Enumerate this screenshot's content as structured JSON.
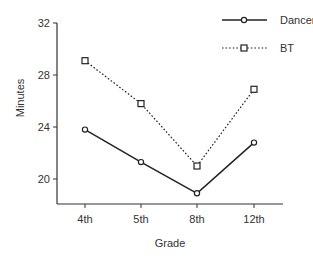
{
  "chart_data": {
    "type": "line",
    "title": "",
    "xlabel": "Grade",
    "ylabel": "Minutes",
    "categories": [
      "4th",
      "5th",
      "8th",
      "12th"
    ],
    "series": [
      {
        "name": "Dancer",
        "values": [
          23.8,
          21.3,
          18.9,
          22.8
        ],
        "line_style": "solid",
        "marker": "circle"
      },
      {
        "name": "BT",
        "values": [
          29.1,
          25.8,
          21.0,
          26.9
        ],
        "line_style": "dotted",
        "marker": "square"
      }
    ],
    "yticks": [
      20,
      24,
      28,
      32
    ],
    "ytick_labels": [
      "20",
      "24",
      "28",
      "32"
    ],
    "ylim": [
      17.9,
      32
    ],
    "grid": false,
    "legend_position": "top-right"
  },
  "colors": {
    "line": "#222222",
    "axis": "#333333",
    "text": "#333333",
    "background": "#ffffff"
  }
}
